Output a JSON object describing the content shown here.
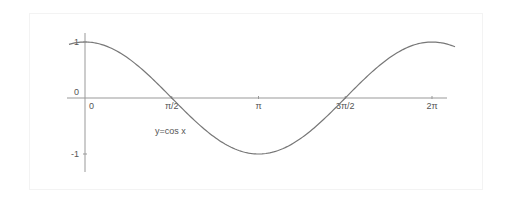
{
  "chart_data": {
    "type": "line",
    "title": "",
    "annotation": "y=cos x",
    "xlabel": "",
    "ylabel": "",
    "x_ticks": [
      {
        "value": 0,
        "label": "0"
      },
      {
        "value": 1.5708,
        "label": "π/2"
      },
      {
        "value": 3.1416,
        "label": "π"
      },
      {
        "value": 4.7124,
        "label": "3π/2"
      },
      {
        "value": 6.2832,
        "label": "2π"
      }
    ],
    "y_ticks": [
      {
        "value": 1,
        "label": "1"
      },
      {
        "value": 0,
        "label": "0"
      },
      {
        "value": -1,
        "label": "-1"
      }
    ],
    "xlim": [
      -0.29,
      6.7
    ],
    "ylim": [
      -1.3,
      1.15
    ],
    "grid": false,
    "legend": "none",
    "series": [
      {
        "name": "y=cos x",
        "function": "cos",
        "x_range": [
          -0.29,
          6.7
        ],
        "color": "#777777"
      }
    ]
  },
  "colors": {
    "axis": "#999999",
    "curve": "#777777",
    "text": "#555555",
    "frame": "#f3f3f3"
  }
}
